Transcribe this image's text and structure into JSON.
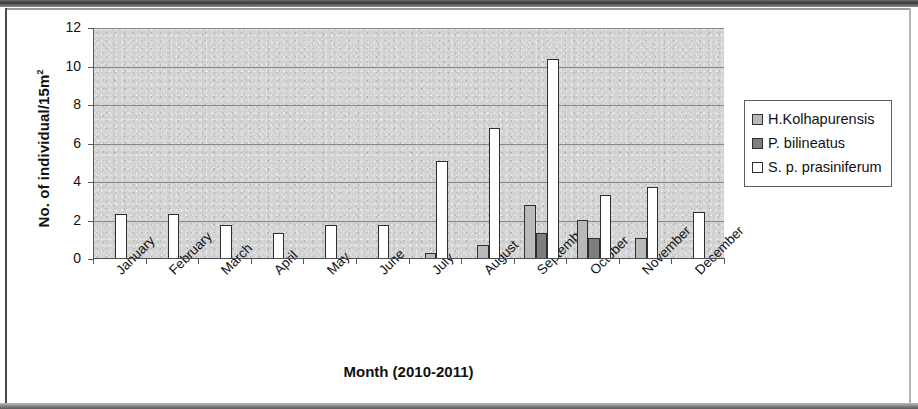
{
  "chart_data": {
    "type": "bar",
    "title": "",
    "xlabel": "Month (2010-2011)",
    "ylabel": "No. of individual/15m2",
    "ylabel_base": "No. of individual/15m",
    "ylabel_sup": "2",
    "ylim": [
      0,
      12
    ],
    "yticks": [
      0,
      2,
      4,
      6,
      8,
      10,
      12
    ],
    "grid": true,
    "legend_position": "right",
    "categories": [
      "January",
      "February",
      "March",
      "April",
      "May",
      "June",
      "July",
      "August",
      "September",
      "October",
      "November",
      "December"
    ],
    "series": [
      {
        "name": "H.Kolhapurensis",
        "color": "#b9b9b9",
        "values": [
          0,
          0,
          0,
          0,
          0,
          0,
          0.3,
          0.75,
          2.8,
          2.05,
          1.1,
          0
        ]
      },
      {
        "name": "P. bilineatus",
        "color": "#7e7e7e",
        "values": [
          0,
          0,
          0,
          0,
          0,
          0,
          0,
          0,
          1.35,
          1.1,
          0,
          0
        ]
      },
      {
        "name": "S. p. prasiniferum",
        "color": "#ffffff",
        "values": [
          2.35,
          2.35,
          1.75,
          1.35,
          1.75,
          1.75,
          5.1,
          6.8,
          10.4,
          3.35,
          3.75,
          2.45
        ]
      }
    ]
  },
  "style": {
    "plot_background": "#d2d2d2",
    "gridline_color": "#86898b",
    "axis_color": "#4a4e50",
    "bar_outline": "#2e2e2e",
    "text_color": "#111111"
  }
}
